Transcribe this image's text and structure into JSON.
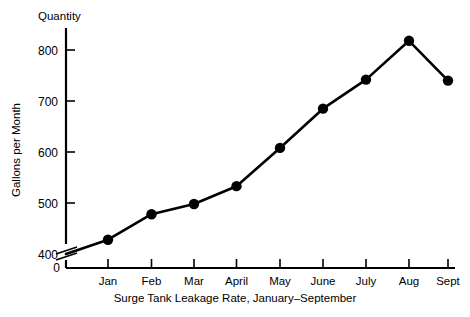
{
  "chart_data": {
    "type": "line",
    "title": "Surge Tank Leakage Rate, January–September",
    "xlabel": "Surge Tank Leakage Rate, January–September",
    "ylabel": "Gallons per Month",
    "y_axis_corner_label": "Quantity",
    "categories": [
      "Jan",
      "Feb",
      "Mar",
      "April",
      "May",
      "June",
      "July",
      "Aug",
      "Sept"
    ],
    "values": [
      428,
      478,
      498,
      533,
      608,
      685,
      742,
      818,
      740
    ],
    "origin_value": 400,
    "ylim": [
      400,
      850
    ],
    "ytick_labels": [
      "400",
      "500",
      "600",
      "700",
      "800"
    ],
    "ytick_values": [
      400,
      500,
      600,
      700,
      800
    ],
    "zero_tick_label": "0",
    "axis_break": true,
    "grid": false,
    "legend": false,
    "marker": "filled-circle",
    "line_color": "#000000",
    "marker_color": "#000000",
    "background_color": "#ffffff"
  },
  "labels": {
    "quantity": "Quantity",
    "y_axis_title": "Gallons per Month",
    "x_axis_title": "Surge Tank Leakage Rate, January–September"
  }
}
